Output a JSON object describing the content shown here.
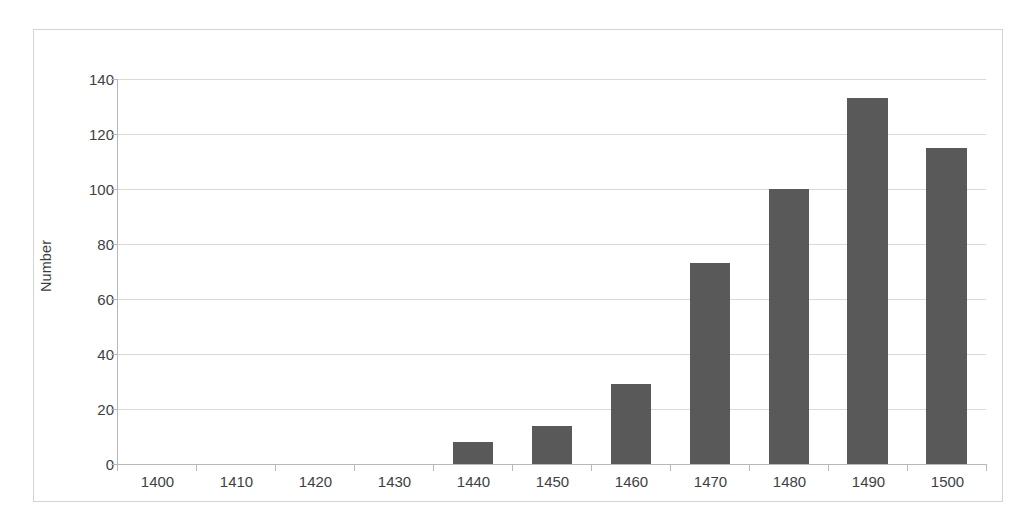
{
  "chart_data": {
    "type": "bar",
    "title": "",
    "xlabel": "",
    "ylabel": "Number",
    "categories": [
      "1400",
      "1410",
      "1420",
      "1430",
      "1440",
      "1450",
      "1460",
      "1470",
      "1480",
      "1490",
      "1500"
    ],
    "values": [
      0,
      0,
      0,
      0,
      8,
      14,
      29,
      73,
      100,
      133,
      115
    ],
    "ylim": [
      0,
      140
    ],
    "ytick_labels": [
      "0",
      "20",
      "40",
      "60",
      "80",
      "100",
      "120",
      "140"
    ],
    "ytick_values": [
      0,
      20,
      40,
      60,
      80,
      100,
      120,
      140
    ],
    "ystep": 20,
    "grid": true,
    "legend": false,
    "legend_position": "none",
    "bar_color": "#595959",
    "gridline_color": "#d9d9d9",
    "axis_color": "#b8b8b8",
    "border_color": "#d3d3d3",
    "text_color": "#3f3f3f",
    "background": "#ffffff"
  }
}
